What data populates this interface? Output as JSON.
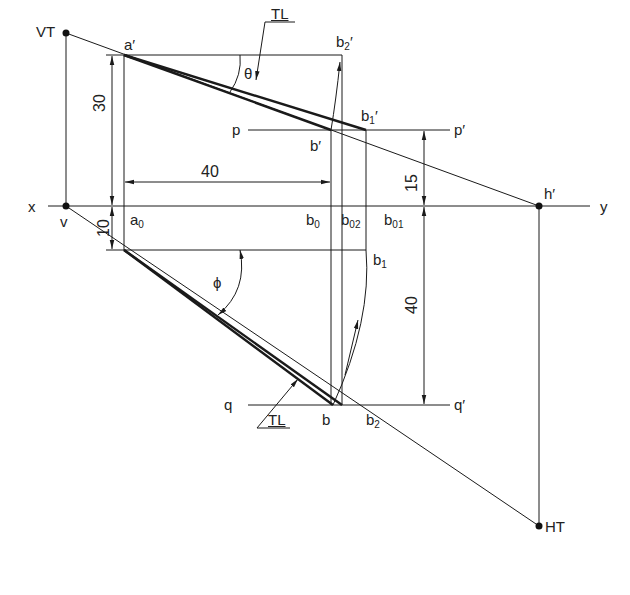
{
  "diagram": {
    "type": "orthographic projection of a line (true length, traces)",
    "reference_line": {
      "left": "x",
      "right": "y"
    },
    "plane_lines": {
      "p": {
        "left": "p",
        "right": "p′"
      },
      "q": {
        "left": "q",
        "right": "q′"
      }
    },
    "points": {
      "VT": "VT",
      "v": "v",
      "a_prime": "a′",
      "a0": "a",
      "a0_sub": "0",
      "b2_prime": "b",
      "b2_prime_sub": "2",
      "b1_prime": "b",
      "b1_prime_sub": "1",
      "b_prime": "b′",
      "b0": "b",
      "b0_sub": "0",
      "b02": "b",
      "b02_sub": "02",
      "b01": "b",
      "b01_sub": "01",
      "b1": "b",
      "b1_sub": "1",
      "b": "b",
      "b2": "b",
      "b2_sub": "2",
      "h_prime": "h′",
      "HT": "HT"
    },
    "angles": {
      "theta": "θ",
      "phi": "ϕ"
    },
    "annotations": {
      "tl_top": "TL",
      "tl_bottom": "TL"
    },
    "dimensions": {
      "a_prime_above_xy": "30",
      "a_below_xy": "10",
      "horizontal_distance": "40",
      "b_prime_above_xy": "15",
      "b_below_xy": "40"
    },
    "colors": {
      "line": "#1a1a1a",
      "background": "#ffffff"
    }
  }
}
